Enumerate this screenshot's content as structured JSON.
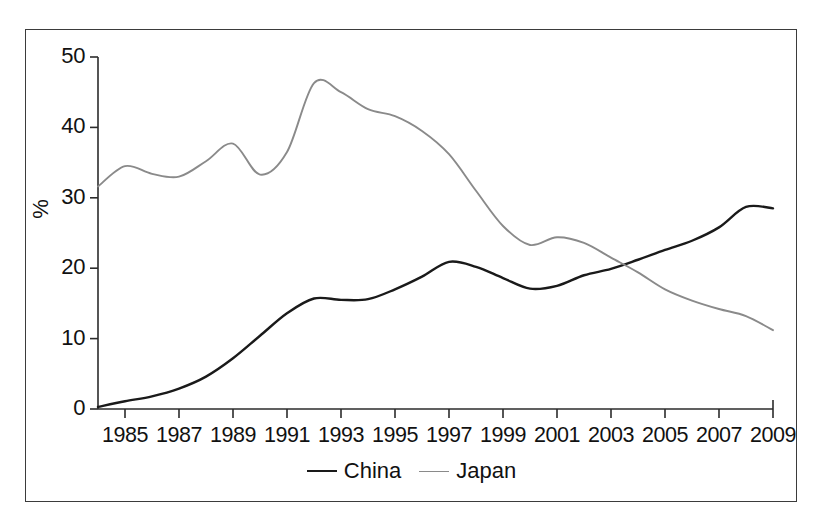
{
  "chart_data": {
    "type": "line",
    "title": "",
    "xlabel": "",
    "ylabel": "%",
    "xlim": [
      1984,
      2009
    ],
    "ylim": [
      0,
      50
    ],
    "grid": false,
    "legend_position": "bottom-center",
    "x": [
      1984,
      1985,
      1986,
      1987,
      1988,
      1989,
      1990,
      1991,
      1992,
      1993,
      1994,
      1995,
      1996,
      1997,
      1998,
      1999,
      2000,
      2001,
      2002,
      2003,
      2004,
      2005,
      2006,
      2007,
      2008,
      2009
    ],
    "xticks": [
      1985,
      1987,
      1989,
      1991,
      1993,
      1995,
      1997,
      1999,
      2001,
      2003,
      2005,
      2007,
      2009
    ],
    "xtick_labels": [
      "1985",
      "1987",
      "1989",
      "1991",
      "1993",
      "1995",
      "1997",
      "1999",
      "2001",
      "2003",
      "2005",
      "2007",
      "2009"
    ],
    "yticks": [
      0,
      10,
      20,
      30,
      40,
      50
    ],
    "ytick_labels": [
      "0",
      "10",
      "20",
      "30",
      "40",
      "50"
    ],
    "series": [
      {
        "name": "China",
        "color": "#1a1a1a",
        "values": [
          0.3,
          1.1,
          1.8,
          2.9,
          4.6,
          7.2,
          10.4,
          13.6,
          15.7,
          15.5,
          15.6,
          17.0,
          18.8,
          20.9,
          20.2,
          18.6,
          17.1,
          17.5,
          19.0,
          19.9,
          21.2,
          22.6,
          23.9,
          25.8,
          28.7,
          28.5
        ]
      },
      {
        "name": "Japan",
        "color": "#8a8a8a",
        "values": [
          31.6,
          34.5,
          33.4,
          33.0,
          35.2,
          37.7,
          33.3,
          36.5,
          46.3,
          45.0,
          42.6,
          41.6,
          39.5,
          36.2,
          31.0,
          26.0,
          23.3,
          24.4,
          23.6,
          21.5,
          19.4,
          17.0,
          15.4,
          14.2,
          13.2,
          11.2
        ]
      }
    ],
    "series_extra_notes": {
      "china_tail": [
        29.5,
        34.0,
        36.9,
        35.2
      ],
      "japan_tail": [
        10.6,
        10.2,
        9.8,
        8.9,
        8.1,
        8.1
      ]
    }
  },
  "legend": {
    "items": [
      {
        "label": "China",
        "color": "#1a1a1a"
      },
      {
        "label": "Japan",
        "color": "#8a8a8a"
      }
    ]
  },
  "axis": {
    "y_title": "%"
  }
}
